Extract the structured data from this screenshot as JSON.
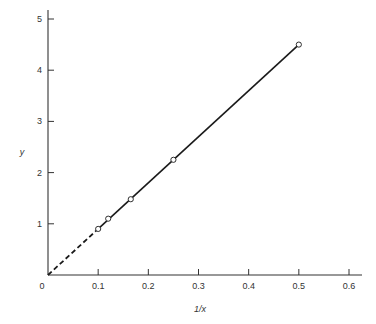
{
  "chart_data": {
    "type": "line",
    "title": "",
    "xlabel": "1/x",
    "ylabel": "y",
    "xlim": [
      0,
      0.6
    ],
    "ylim": [
      0,
      5
    ],
    "x_ticks": [
      0,
      0.1,
      0.2,
      0.3,
      0.4,
      0.5,
      0.6
    ],
    "x_tick_labels": [
      "0",
      "0.1",
      "0.2",
      "0.3",
      "0.4",
      "0.5",
      "0.6"
    ],
    "y_ticks": [
      1,
      2,
      3,
      4,
      5
    ],
    "y_tick_labels": [
      "1",
      "2",
      "3",
      "4",
      "5"
    ],
    "grid": false,
    "legend": null,
    "series": [
      {
        "name": "data points",
        "style": "open-circle markers",
        "x": [
          0.1,
          0.12,
          0.165,
          0.25,
          0.5
        ],
        "y": [
          0.9,
          1.1,
          1.48,
          2.25,
          4.5
        ]
      },
      {
        "name": "fitted line",
        "style": "solid",
        "x": [
          0.1,
          0.5
        ],
        "y": [
          0.9,
          4.5
        ]
      },
      {
        "name": "extrapolation",
        "style": "dashed",
        "x": [
          0,
          0.1
        ],
        "y": [
          0,
          0.9
        ]
      }
    ]
  },
  "colors": {
    "axis": "#333333",
    "line": "#1a1a1a",
    "marker_fill": "#ffffff"
  }
}
